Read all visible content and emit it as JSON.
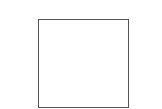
{
  "diagram": {
    "shapes": [
      {
        "type": "square",
        "fill": "#ffffff",
        "stroke": "#555555",
        "stroke_width": 1
      }
    ]
  }
}
